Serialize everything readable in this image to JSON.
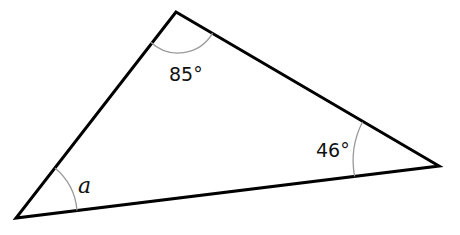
{
  "diagram": {
    "type": "triangle",
    "vertices": {
      "top": [
        176,
        12
      ],
      "right": [
        439,
        166
      ],
      "bottom_left": [
        16,
        218
      ]
    },
    "angles": [
      {
        "vertex": "top",
        "label": "85°"
      },
      {
        "vertex": "right",
        "label": "46°"
      },
      {
        "vertex": "bottom_left",
        "label": "a"
      }
    ],
    "colors": {
      "edge": "#000000",
      "arc": "#999999",
      "text": "#111111"
    }
  }
}
